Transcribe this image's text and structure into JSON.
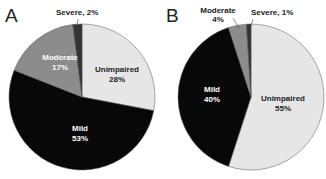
{
  "chart_data": [
    {
      "type": "pie",
      "panel": "A",
      "categories": [
        "Unimpaired",
        "Mild",
        "Moderate",
        "Severe"
      ],
      "values": [
        28,
        53,
        17,
        2
      ],
      "labels": [
        "Unimpaired\n28%",
        "Mild\n53%",
        "Moderate\n17%",
        "Severe, 2%"
      ],
      "colors": [
        "#e6e6e6",
        "#080808",
        "#8c8c8c",
        "#333333"
      ],
      "start_angle_deg_clockwise_from_top": 0,
      "legend": "none"
    },
    {
      "type": "pie",
      "panel": "B",
      "categories": [
        "Unimpaired",
        "Mild",
        "Moderate",
        "Severe"
      ],
      "values": [
        55,
        40,
        4,
        1
      ],
      "labels": [
        "Unimpaired\n55%",
        "Mild\n40%",
        "Moderate\n4%",
        "Severe, 1%"
      ],
      "colors": [
        "#e6e6e6",
        "#080808",
        "#8c8c8c",
        "#333333"
      ],
      "start_angle_deg_clockwise_from_top": 0,
      "legend": "none"
    }
  ],
  "panels": {
    "a": {
      "letter": "A",
      "unimpaired_name": "Unimpaired",
      "unimpaired_pct": "28%",
      "mild_name": "Mild",
      "mild_pct": "53%",
      "moderate_name": "Moderate",
      "moderate_pct": "17%",
      "severe_label": "Severe, 2%"
    },
    "b": {
      "letter": "B",
      "unimpaired_name": "Unimpaired",
      "unimpaired_pct": "55%",
      "mild_name": "Mild",
      "mild_pct": "40%",
      "moderate_name": "Moderate",
      "moderate_pct": "4%",
      "severe_label": "Severe, 1%"
    }
  }
}
